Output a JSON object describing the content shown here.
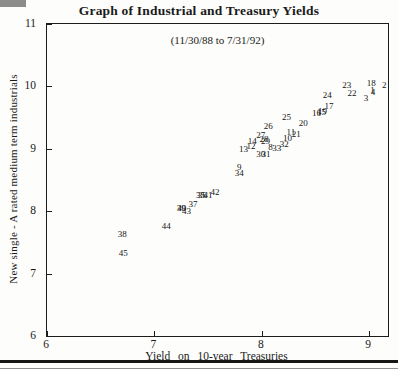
{
  "chart_data": {
    "type": "scatter",
    "title": "Graph of Industrial and Treasury Yields",
    "subtitle": "(11/30/88 to 7/31/92)",
    "xlabel": "Yield on 10-year Treasuries",
    "ylabel": "New single - A rated medium term industrials",
    "xlim": [
      6,
      9.175
    ],
    "ylim": [
      6,
      11
    ],
    "x_ticks": [
      6,
      7,
      8,
      9
    ],
    "y_ticks": [
      6,
      7,
      8,
      9,
      10,
      11
    ],
    "grid": false,
    "marker_style": "observation-number-text-labels",
    "points": [
      {
        "label": "1",
        "x": 9.03,
        "y": 9.95
      },
      {
        "label": "2",
        "x": 9.14,
        "y": 10.02
      },
      {
        "label": "3",
        "x": 8.97,
        "y": 9.81
      },
      {
        "label": "4",
        "x": 9.035,
        "y": 9.905
      },
      {
        "label": "8",
        "x": 8.08,
        "y": 9.03
      },
      {
        "label": "9",
        "x": 7.79,
        "y": 8.71
      },
      {
        "label": "10",
        "x": 8.24,
        "y": 9.18
      },
      {
        "label": "11",
        "x": 8.27,
        "y": 9.27
      },
      {
        "label": "12",
        "x": 7.9,
        "y": 9.04
      },
      {
        "label": "13",
        "x": 7.83,
        "y": 9.0
      },
      {
        "label": "14",
        "x": 7.91,
        "y": 9.13
      },
      {
        "label": "15",
        "x": 8.555,
        "y": 9.595
      },
      {
        "label": "16",
        "x": 8.51,
        "y": 9.58
      },
      {
        "label": "17",
        "x": 8.625,
        "y": 9.68
      },
      {
        "label": "18",
        "x": 9.02,
        "y": 10.06
      },
      {
        "label": "19",
        "x": 8.565,
        "y": 9.6
      },
      {
        "label": "20",
        "x": 8.385,
        "y": 9.42
      },
      {
        "label": "21",
        "x": 8.32,
        "y": 9.23
      },
      {
        "label": "22",
        "x": 8.84,
        "y": 9.89
      },
      {
        "label": "23",
        "x": 8.79,
        "y": 10.02
      },
      {
        "label": "24",
        "x": 8.61,
        "y": 9.87
      },
      {
        "label": "25",
        "x": 8.23,
        "y": 9.51
      },
      {
        "label": "26",
        "x": 8.06,
        "y": 9.36
      },
      {
        "label": "27",
        "x": 7.99,
        "y": 9.22
      },
      {
        "label": "28",
        "x": 8.02,
        "y": 9.15
      },
      {
        "label": "29",
        "x": 8.035,
        "y": 9.125
      },
      {
        "label": "30",
        "x": 7.99,
        "y": 8.92
      },
      {
        "label": "31",
        "x": 8.04,
        "y": 8.92
      },
      {
        "label": "32",
        "x": 8.21,
        "y": 9.08
      },
      {
        "label": "33",
        "x": 8.14,
        "y": 9.01
      },
      {
        "label": "34",
        "x": 7.79,
        "y": 8.62
      },
      {
        "label": "35",
        "x": 7.43,
        "y": 8.26
      },
      {
        "label": "36",
        "x": 7.445,
        "y": 8.26
      },
      {
        "label": "37",
        "x": 7.36,
        "y": 8.12
      },
      {
        "label": "38",
        "x": 6.7,
        "y": 7.63
      },
      {
        "label": "39",
        "x": 7.25,
        "y": 8.05
      },
      {
        "label": "40",
        "x": 7.255,
        "y": 8.05
      },
      {
        "label": "41",
        "x": 7.5,
        "y": 8.26
      },
      {
        "label": "42",
        "x": 7.565,
        "y": 8.31
      },
      {
        "label": "43",
        "x": 7.3,
        "y": 8.01
      },
      {
        "label": "44",
        "x": 7.11,
        "y": 7.77
      },
      {
        "label": "45",
        "x": 6.71,
        "y": 7.33
      }
    ]
  }
}
